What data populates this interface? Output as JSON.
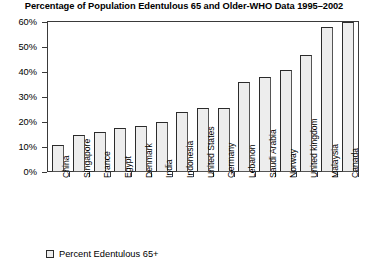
{
  "chart_data": {
    "type": "bar",
    "title": "Percentage of Population Edentulous 65 and Older-WHO Data 1995–2002",
    "xlabel": "",
    "ylabel": "",
    "ylim": [
      0,
      60
    ],
    "ytick_step": 10,
    "ytick_labels": [
      "60%",
      "50%",
      "40%",
      "30%",
      "20%",
      "10%",
      "0%"
    ],
    "ytick_values": [
      60,
      50,
      40,
      30,
      20,
      10,
      0
    ],
    "grid": false,
    "legend_position": "bottom-left",
    "series_name": "Percent Edentulous 65+",
    "bar_fill_color": "#ededed",
    "bar_border_color": "#2b2b2b",
    "categories": [
      "China",
      "Singapore",
      "France",
      "Egypt",
      "Denmark",
      "India",
      "Indonesia",
      "United States",
      "Germany",
      "Lebanon",
      "Saudi Arabia",
      "Norway",
      "United kingdom",
      "Malaysia",
      "Canada"
    ],
    "values": [
      11,
      15,
      16,
      17.5,
      18.5,
      20,
      24,
      25.5,
      25.5,
      36,
      38,
      41,
      47,
      58,
      60
    ],
    "legend": [
      {
        "label": "Percent Edentulous 65+",
        "color": "#ededed"
      }
    ]
  }
}
